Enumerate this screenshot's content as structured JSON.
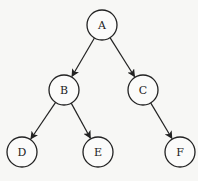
{
  "diagram": {
    "type": "binary-tree",
    "nodes": [
      {
        "id": "A",
        "label": "A"
      },
      {
        "id": "B",
        "label": "B"
      },
      {
        "id": "C",
        "label": "C"
      },
      {
        "id": "D",
        "label": "D"
      },
      {
        "id": "E",
        "label": "E"
      },
      {
        "id": "F",
        "label": "F"
      }
    ],
    "edges": [
      {
        "from": "A",
        "to": "B"
      },
      {
        "from": "A",
        "to": "C"
      },
      {
        "from": "B",
        "to": "D"
      },
      {
        "from": "B",
        "to": "E"
      },
      {
        "from": "C",
        "to": "F"
      }
    ]
  }
}
